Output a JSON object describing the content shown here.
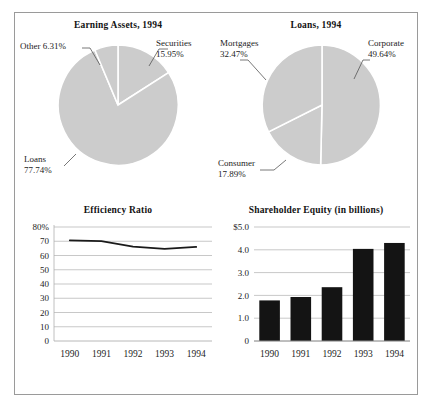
{
  "figure": {
    "background": "#ffffff",
    "frame_color": "#9a9a9a"
  },
  "panels": {
    "earning_assets": {
      "title": "Earning Assets, 1994"
    },
    "loans": {
      "title": "Loans, 1994"
    },
    "efficiency": {
      "title": "Efficiency Ratio"
    },
    "equity": {
      "title": "Shareholder Equity (in billions)"
    }
  },
  "labels": {
    "earning_assets": {
      "other_name": "Other 6.31%",
      "securities_name": "Securities",
      "securities_value": "15.95%",
      "loans_name": "Loans",
      "loans_value": "77.74%"
    },
    "loans": {
      "mortgages_name": "Mortgages",
      "mortgages_value": "32.47%",
      "corporate_name": "Corporate",
      "corporate_value": "49.64%",
      "consumer_name": "Consumer",
      "consumer_value": "17.89%"
    }
  },
  "axes": {
    "efficiency": {
      "y_ticks": [
        "80%",
        "70",
        "60",
        "50",
        "40",
        "30",
        "20",
        "10",
        "0"
      ],
      "x_ticks": [
        "1990",
        "1991",
        "1992",
        "1993",
        "1994"
      ]
    },
    "equity": {
      "y_ticks": [
        "$5.0",
        "4.0",
        "3.0",
        "2.0",
        "1.0",
        "0"
      ],
      "x_ticks": [
        "1990",
        "1991",
        "1992",
        "1993",
        "1994"
      ]
    }
  },
  "chart_data": [
    {
      "type": "pie",
      "title": "Earning Assets, 1994",
      "slice_fill": "#cccccc",
      "slice_edge": "#ffffff",
      "start_angle_deg": 0,
      "direction": "clockwise",
      "categories": [
        "Securities",
        "Loans",
        "Other"
      ],
      "values": [
        15.95,
        77.74,
        6.31
      ],
      "labels": [
        "Securities 15.95%",
        "Loans 77.74%",
        "Other 6.31%"
      ],
      "legend": "none",
      "grid": false
    },
    {
      "type": "pie",
      "title": "Loans, 1994",
      "slice_fill": "#cccccc",
      "slice_edge": "#ffffff",
      "start_angle_deg": 0,
      "direction": "clockwise",
      "categories": [
        "Corporate",
        "Consumer",
        "Mortgages"
      ],
      "values": [
        49.64,
        17.89,
        32.47
      ],
      "labels": [
        "Corporate 49.64%",
        "Consumer 17.89%",
        "Mortgages 32.47%"
      ],
      "legend": "none",
      "grid": false
    },
    {
      "type": "line",
      "title": "Efficiency Ratio",
      "x": [
        "1990",
        "1991",
        "1992",
        "1993",
        "1994"
      ],
      "values": [
        70.6,
        70.1,
        66.2,
        64.6,
        66.0
      ],
      "ylim": [
        0,
        80
      ],
      "yticks": [
        0,
        10,
        20,
        30,
        40,
        50,
        60,
        70,
        80
      ],
      "ytick_labels": [
        "0",
        "10",
        "20",
        "30",
        "40",
        "50",
        "60",
        "70",
        "80%"
      ],
      "xlabel": "",
      "ylabel": "",
      "grid": true,
      "line_color": "#1a1a1a",
      "line_width": 1.8
    },
    {
      "type": "bar",
      "title": "Shareholder Equity (in billions)",
      "categories": [
        "1990",
        "1991",
        "1992",
        "1993",
        "1994"
      ],
      "values": [
        1.78,
        1.93,
        2.36,
        4.04,
        4.3
      ],
      "ylim": [
        0,
        5
      ],
      "yticks": [
        0,
        1,
        2,
        3,
        4,
        5
      ],
      "ytick_labels": [
        "0",
        "1.0",
        "2.0",
        "3.0",
        "4.0",
        "$5.0"
      ],
      "xlabel": "",
      "ylabel": "",
      "grid": true,
      "bar_color": "#141414"
    }
  ]
}
